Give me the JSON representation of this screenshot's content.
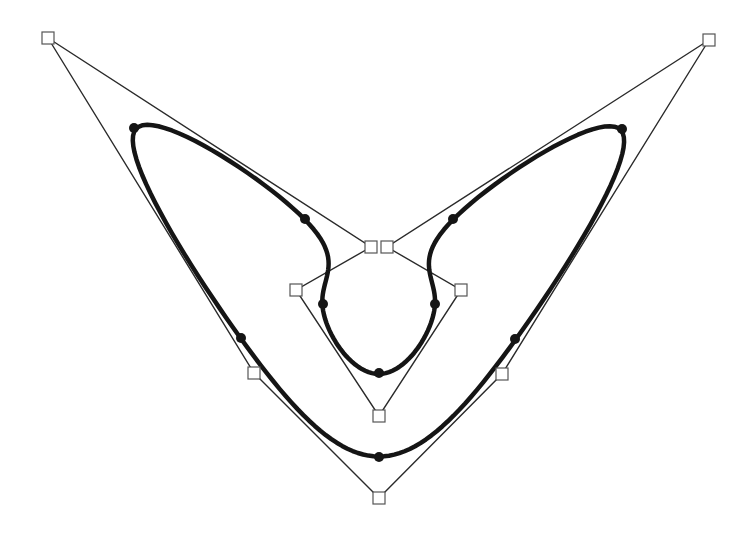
{
  "diagram": {
    "type": "closed-spline-with-control-polygon",
    "colors": {
      "background": "#ffffff",
      "polygon": "#2a2a2a",
      "curve": "#151515",
      "control_point_fill": "#ffffff",
      "control_point_stroke": "#555555",
      "curve_point": "#151515"
    },
    "control_points": [
      {
        "x": 48,
        "y": 38
      },
      {
        "x": 371,
        "y": 247
      },
      {
        "x": 296,
        "y": 290
      },
      {
        "x": 379,
        "y": 416
      },
      {
        "x": 461,
        "y": 290
      },
      {
        "x": 387,
        "y": 247
      },
      {
        "x": 709,
        "y": 40
      },
      {
        "x": 502,
        "y": 374
      },
      {
        "x": 379,
        "y": 498
      },
      {
        "x": 254,
        "y": 373
      }
    ],
    "curve_points": [
      {
        "x": 134,
        "y": 128
      },
      {
        "x": 305,
        "y": 219
      },
      {
        "x": 323,
        "y": 304
      },
      {
        "x": 379,
        "y": 373
      },
      {
        "x": 435,
        "y": 304
      },
      {
        "x": 453,
        "y": 219
      },
      {
        "x": 622,
        "y": 129
      },
      {
        "x": 515,
        "y": 339
      },
      {
        "x": 379,
        "y": 457
      },
      {
        "x": 241,
        "y": 338
      }
    ]
  }
}
